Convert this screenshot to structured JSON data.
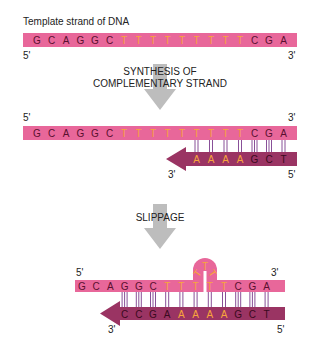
{
  "colors": {
    "template_strand": "#e8679a",
    "complementary_strand": "#9a3463",
    "base_default": "#5a1030",
    "base_default_dark": "#3a0a20",
    "base_repeat": "#f7a53c",
    "bond": "#7b3c8c",
    "process_arrow": "#bdbdbd",
    "label": "#222222"
  },
  "title": "Template strand of DNA",
  "steps": [
    {
      "caption_lines": [
        "SYNTHESIS OF",
        "COMPLEMENTARY STRAND"
      ]
    },
    {
      "caption_lines": [
        "SLIPPAGE"
      ]
    }
  ],
  "panels": [
    {
      "name": "template-only",
      "template": {
        "bases": [
          "G",
          "C",
          "A",
          "G",
          "G",
          "C",
          "T",
          "T",
          "T",
          "T",
          "T",
          "T",
          "T",
          "T",
          "T",
          "C",
          "G",
          "A"
        ],
        "end_left": "5'",
        "end_right": "3'"
      }
    },
    {
      "name": "synthesis",
      "template": {
        "bases": [
          "G",
          "C",
          "A",
          "G",
          "G",
          "C",
          "T",
          "T",
          "T",
          "T",
          "T",
          "T",
          "T",
          "T",
          "T",
          "C",
          "G",
          "A"
        ],
        "end_left": "5'",
        "end_right": "3'"
      },
      "complement": {
        "bases": [
          "A",
          "A",
          "A",
          "A",
          "G",
          "C",
          "T"
        ],
        "end_left": "3'",
        "end_right": "5'"
      }
    },
    {
      "name": "slippage",
      "template": {
        "bases": [
          "G",
          "C",
          "A",
          "G",
          "G",
          "C",
          "T",
          "T",
          "T",
          "T",
          "T",
          "C",
          "G",
          "A"
        ],
        "loop_bases": [
          "T",
          "T",
          "T"
        ],
        "end_left": "5'",
        "end_right": "3'"
      },
      "complement": {
        "bases": [
          "C",
          "C",
          "G",
          "A",
          "A",
          "A",
          "A",
          "A",
          "G",
          "C",
          "T"
        ],
        "end_left": "3'",
        "end_right": "5'"
      }
    }
  ]
}
